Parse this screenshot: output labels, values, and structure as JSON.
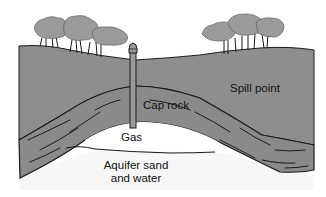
{
  "diagram": {
    "type": "geological cross-section",
    "labels": {
      "spill_point": "Spill point",
      "cap_rock": "Cap rock",
      "gas": "Gas",
      "aquifer_line1": "Aquifer sand",
      "aquifer_line2": "and water"
    },
    "elements": [
      "trees-left",
      "trees-right",
      "ground-surface",
      "well-pipe",
      "cap-rock-layer",
      "gas-pocket",
      "aquifer-zone"
    ],
    "colors": {
      "ground": "#8e8e8e",
      "tree_canopy": "#9a9a9a",
      "outline": "#1a1a1a",
      "background": "#ffffff",
      "gas": "#ffffff",
      "aquifer": "#f7f7f7"
    }
  }
}
